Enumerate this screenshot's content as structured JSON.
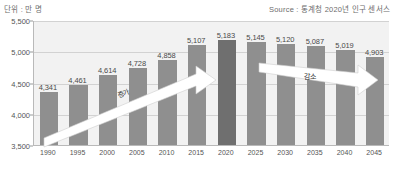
{
  "header": {
    "unit_label": "단위 : 만 명",
    "source_label": "Source : 통계청 2020년 인구 센서스"
  },
  "annotations": {
    "increase_label": "증가",
    "decrease_label": "감소"
  },
  "colors": {
    "bar": "#8f8f8f",
    "bar_peak": "#6f6f6f",
    "plot_background": "#f2f2f2",
    "gridline": "#d2d2d2",
    "axis": "#b9b9b9",
    "arrow_fill": "#ffffff"
  },
  "chart_data": {
    "type": "bar",
    "title": "",
    "xlabel": "",
    "ylabel": "단위 : 만 명",
    "ylim": [
      3500,
      5500
    ],
    "yticks": [
      "3,500",
      "4,000",
      "4,500",
      "5,000",
      "5,500"
    ],
    "ytick_values": [
      3500,
      4000,
      4500,
      5000,
      5500
    ],
    "grid": true,
    "legend": "none",
    "categories": [
      "1990",
      "1995",
      "2000",
      "2005",
      "2010",
      "2015",
      "2020",
      "2025",
      "2030",
      "2035",
      "2040",
      "2045"
    ],
    "values": [
      4341,
      4461,
      4614,
      4728,
      4858,
      5107,
      5183,
      5145,
      5120,
      5087,
      5019,
      4903
    ],
    "value_labels": [
      "4,341",
      "4,461",
      "4,614",
      "4,728",
      "4,858",
      "5,107",
      "5,183",
      "5,145",
      "5,120",
      "5,087",
      "5,019",
      "4,903"
    ],
    "peak_index": 6,
    "annotations": [
      {
        "text": "증가",
        "from": "1990",
        "to": "2020",
        "direction": "up"
      },
      {
        "text": "감소",
        "from": "2020",
        "to": "2045",
        "direction": "down"
      }
    ]
  }
}
